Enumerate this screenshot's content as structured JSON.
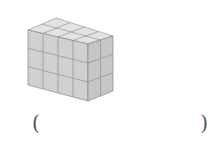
{
  "figure": {
    "front_columns": 4,
    "rows": 3,
    "depth": 2,
    "colors": {
      "front": "#d4d4d4",
      "side": "#c2c2c2",
      "top": "#e2e2e2",
      "grid": "#7a7a7a"
    }
  },
  "answer": {
    "left_paren": "(",
    "right_paren": ")",
    "value": ""
  }
}
